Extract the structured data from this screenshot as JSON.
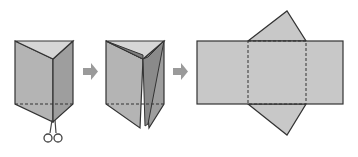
{
  "diagram": {
    "steps": [
      {
        "id": "prism",
        "label": "Closed triangular prism with scissors at bottom edge"
      },
      {
        "id": "prism-cut",
        "label": "Prism cut open along vertical edge"
      },
      {
        "id": "net",
        "label": "Unfolded net: three rectangles and two triangles"
      }
    ],
    "arrows": 2,
    "colors": {
      "face_front": "#b4b4b4",
      "face_side": "#9e9e9e",
      "face_top": "#d6d6d6",
      "net_fill": "#c8c8c8",
      "edge": "#333333",
      "arrow": "#9a9a9a"
    }
  }
}
